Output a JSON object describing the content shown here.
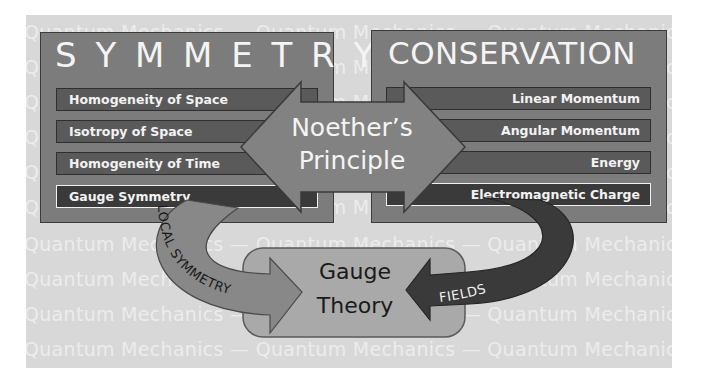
{
  "background": {
    "rows": [
      "Quantum  Mechanics  —  Quantum  Mechanics  —  Quantum  Mechanics",
      "Quantum  Mechanics  —  Quantum  Mechanics  —  Quantum  Mechanics",
      "Quantum  Mechanics  —  Quantum  Mechanics  —  Quantum  Mechanics",
      "Quantum  Mechanics  —  Quantum  Mechanics  —  Quantum  Mechanics",
      "Quantum  Mechanics  —  Quantum  Mechanics  —  Quantum  Mechanics",
      "Quantum  Mechanics  —  Quantum  Mechanics  —  Quantum  Mechanics",
      "Quantum  Mechanics  —  Quantum  Mechanics  —  Quantum  Mechanics",
      "Quantum  Mechanics  —  Quantum  Mechanics  —  Quantum  Mechanics",
      "Quantum  Mechanics  —  Quantum  Mechanics  —  Quantum  Mechanics",
      "Quantum  Mechanics  —  Quantum  Mechanics  —  Quantum  Mechanics",
      "Quantum  Mechanics  —  Quantum  Mechanics  —  Quantum  Mechanics",
      "Quantum  Mechanics  —  Quantum  Mechanics  —  Quantum  Mechanics",
      "Quantum  Mechanics  —  Quantum  Mechanics  —  Quantum  Mechanics",
      "Quantum  Mechanics  —  Quantum  Mechanics  —  Quantum  Mechanics",
      "Quantum  Mechanics  —  Quantum  Mechanics  —  Quantum  Mechanics",
      "Quantum  Mechanics  —  Quantum  Mechanics  —  Quantum  Mechanics",
      "Quantum  Mechanics  —  Quantum  Mechanics  —  Quantum  Mechanics",
      "Quantum  Mechanics  —  Quantum  Mechanics  —  Quantum  Mechanics",
      "Quantum  Mechanics  —  Quantum  Mechanics  —  Quantum  Mechanics",
      "Quantum  Mechanics  —  Quantum  Mechanics  —  Quantum  Mechanics",
      "Quantum  Mechanics  —  Quantum  Mechanics  —  Quantum  Mechanics",
      "Quantum  Mechanics  —  Quantum  Mechanics  —  Quantum  Mechanics",
      "Quantum  Mechanics  —  Quantum  Mechanics  —  Quantum  Mechanics",
      "Quantum  Mechanics  —  Quantum  Mechanics  —  Quantum  Mechanics",
      "Quantum  Mechanics  —  Quantum  Mechanics  —  Quantum  Mechanics",
      "Quantum  Mechanics  —  Quantum  Mechanics  —  Quantum  Mechanics",
      "Quantum  Mechanics  —  Quantum  Mechanics  —  Quantum  Mechanics",
      "Quantum  Mechanics  —  Quantum  Mechanics  —  Quantum  Mechanics",
      "Quantum  Mechanics  —  Quantum  Mechanics  —  Quantum  Mechanics",
      "Quantum  Mechanics  —  Quantum  Mechanics  —  Quantum  Mechanics",
      "Quantum  Mechanics  —  Quantum  Mechanics  —  Quantum  Mechanics",
      "Quantum  Mechanics  —  Quantum  Mechanics  —  Quantum  Mechanics",
      "Quantum  Mechanics  —  Quantum  Mechanics  —  Quantum  Mechanics",
      "Quantum  Mechanics  —  Quantum  Mechanics  —  Quantum  Mechanics",
      "Quantum  Mechanics  —  Quantum  Mechanics  —  Quantum  Mechanics",
      "Quantum  Mechanics  —  Quantum  Mechanics  —  Quantum  Mechanics",
      "Quantum  Mechanics  —  Quantum  Mechanics  —  Quantum  Mechanics",
      "Quantum  Mechanics  —  Quantum  Mechanics  —  Quantum  Mechanics",
      "Quantum  Mechanics  —  Quantum  Mechanics  —  Quantum  Mechanics",
      "Quantum  Mechanics  —  Quantum  Mechanics  —  Quantum  Mechanics"
    ]
  },
  "symmetry": {
    "title": "S Y M M E T R Y",
    "items": [
      "Homogeneity of Space",
      "Isotropy of Space",
      "Homogeneity of Time",
      "Gauge Symmetry"
    ]
  },
  "conservation": {
    "title": "CONSERVATION",
    "items": [
      "Linear Momentum",
      "Angular Momentum",
      "Energy",
      "Electromagnetic Charge"
    ]
  },
  "center": {
    "line1": "Noether’s",
    "line2": "Principle"
  },
  "gauge": {
    "line1": "Gauge",
    "line2": "Theory"
  },
  "arrows": {
    "left_label": "LOCAL SYMMETRY",
    "right_label": "FIELDS"
  },
  "colors": {
    "panel": "#d8d8d8",
    "box": "#7c7c7c",
    "bar": "#5a5a5a",
    "bar_dark": "#3a3a3a",
    "noether": "#808080",
    "local_arrow": "#8a8a8a",
    "fields_arrow": "#3a3a3a",
    "gauge_box": "#a8a8a8"
  }
}
